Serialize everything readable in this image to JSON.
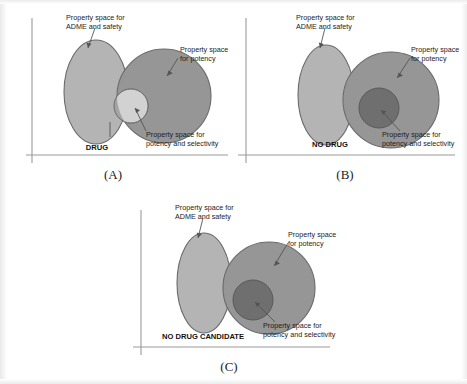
{
  "figure": {
    "colors": {
      "adme_fill": "#b4b4b4",
      "potency_fill": "#969696",
      "selectivity_fill_light": "#d2d2d2",
      "selectivity_fill_dark": "#6f6f6f",
      "shape_stroke": "#6a6a6a",
      "axis": "#9a9a9a",
      "leader": "#555555",
      "text": "#1c1c1c",
      "background": "#ffffff"
    },
    "labels": {
      "adme": "Property space for\nADME and safety",
      "adme_line1": "Property space for",
      "adme_line2": "ADME and safety",
      "potency_line1": "Property space",
      "potency_line2": "for potency",
      "selectivity_line1": "Property space for",
      "selectivity_line2": "potency and selectivity"
    },
    "panels": [
      {
        "id": "A",
        "caption": "(A)",
        "outcome": "DRUG",
        "outcome_style": "bold",
        "description": "ADME ellipse overlaps potency circle; selectivity circle straddles the boundary",
        "selectivity_tone": "light",
        "overlap": "overlapping"
      },
      {
        "id": "B",
        "caption": "(B)",
        "outcome": "NO DRUG",
        "outcome_style": "bold",
        "description": "ADME ellipse touches potency circle; selectivity circle lies fully inside potency only",
        "selectivity_tone": "dark",
        "overlap": "tangent"
      },
      {
        "id": "C",
        "caption": "(C)",
        "outcome": "NO DRUG CANDIDATE",
        "outcome_style": "bold",
        "description": "ADME ellipse and potency circle are disjoint; selectivity circle inside potency only",
        "selectivity_tone": "dark",
        "overlap": "separate"
      }
    ]
  }
}
